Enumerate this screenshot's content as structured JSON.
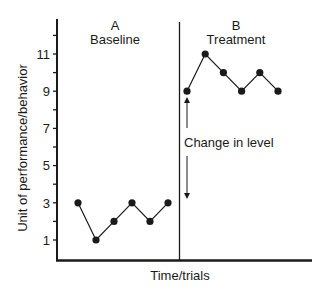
{
  "chart_data": {
    "type": "line",
    "title": "",
    "xlabel": "Time/trials",
    "ylabel": "Unit of performance/behavior",
    "ylim": [
      0,
      12.5
    ],
    "yticks_labeled": [
      1,
      3,
      5,
      7,
      9,
      11
    ],
    "yticks_minor": [
      2,
      4,
      6,
      8,
      10,
      12
    ],
    "grid": false,
    "legend": null,
    "phases": [
      {
        "letter": "A",
        "name": "Baseline"
      },
      {
        "letter": "B",
        "name": "Treatment"
      }
    ],
    "series": [
      {
        "name": "Baseline",
        "phase": "A",
        "x": [
          1,
          2,
          3,
          4,
          5,
          6
        ],
        "values": [
          3,
          1,
          2,
          3,
          2,
          3
        ]
      },
      {
        "name": "Treatment",
        "phase": "B",
        "x": [
          7,
          8,
          9,
          10,
          11,
          12
        ],
        "values": [
          9,
          11,
          10,
          9,
          10,
          9
        ]
      }
    ],
    "annotations": [
      {
        "text": "Change in level",
        "type": "double-arrow",
        "from_value": 3,
        "to_value": 9
      }
    ]
  },
  "labels": {
    "phase_a_letter": "A",
    "phase_a_name": "Baseline",
    "phase_b_letter": "B",
    "phase_b_name": "Treatment",
    "annotation": "Change in level",
    "xlabel": "Time/trials",
    "ylabel": "Unit of performance/behavior",
    "ticks": {
      "t1": "1",
      "t3": "3",
      "t5": "5",
      "t7": "7",
      "t9": "9",
      "t11": "11"
    }
  }
}
